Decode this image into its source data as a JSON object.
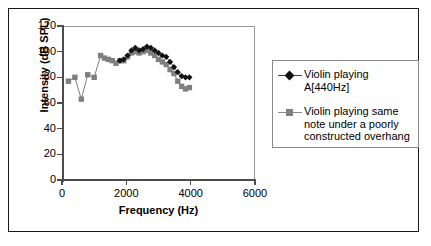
{
  "chart_data": {
    "type": "line",
    "title": "",
    "xlabel": "Frequency (Hz)",
    "ylabel": "Intensity (dB SPL)",
    "xlim": [
      0,
      6000
    ],
    "ylim": [
      0,
      120
    ],
    "xticks": [
      "0",
      "2000",
      "4000",
      "6000"
    ],
    "xtick_values": [
      0,
      2000,
      4000,
      6000
    ],
    "yticks": [
      "0",
      "20",
      "40",
      "60",
      "80",
      "100",
      "120"
    ],
    "ytick_values": [
      0,
      20,
      40,
      60,
      80,
      100,
      120
    ],
    "grid": false,
    "legend_position": "right-outside",
    "series": [
      {
        "name": "Violin playing A[440Hz]",
        "label_lines": "Violin playing\nA[440Hz]",
        "marker": "diamond",
        "color": "#111111",
        "line_color": "#444444",
        "x": [
          1800,
          1920,
          2040,
          2160,
          2280,
          2400,
          2520,
          2640,
          2760,
          2880,
          3000,
          3120,
          3240,
          3360,
          3480,
          3600,
          3720,
          3840,
          3960
        ],
        "y": [
          93,
          94,
          97,
          101,
          103,
          101,
          102,
          104,
          103,
          101,
          99,
          97,
          96,
          92,
          88,
          84,
          81,
          80,
          80
        ]
      },
      {
        "name": "Violin playing same note under a poorly constructed overhang",
        "label_lines": "Violin playing same\nnote under a poorly\nconstructed overhang",
        "marker": "square",
        "color": "#7f7f7f",
        "line_color": "#6f6f6f",
        "x": [
          200,
          400,
          600,
          800,
          1000,
          1200,
          1320,
          1440,
          1560,
          1680,
          1800,
          1920,
          2040,
          2160,
          2280,
          2400,
          2520,
          2640,
          2760,
          2880,
          3000,
          3120,
          3240,
          3360,
          3480,
          3600,
          3720,
          3840,
          3960
        ],
        "y": [
          77,
          80,
          63,
          82,
          80,
          97,
          95,
          94,
          93,
          91,
          93,
          93,
          96,
          99,
          100,
          99,
          100,
          101,
          99,
          97,
          94,
          92,
          90,
          86,
          83,
          77,
          73,
          71,
          72
        ]
      }
    ]
  },
  "legend": {
    "entries": [
      {
        "text": "Violin playing\nA[440Hz]",
        "marker": "diamond-marker",
        "color": "#111111"
      },
      {
        "text": "Violin playing same\nnote under a poorly\nconstructed overhang",
        "marker": "square-marker",
        "color": "#7f7f7f"
      }
    ]
  },
  "axes": {
    "x_title": "Frequency (Hz)",
    "y_title": "Intensity (dB SPL)"
  }
}
